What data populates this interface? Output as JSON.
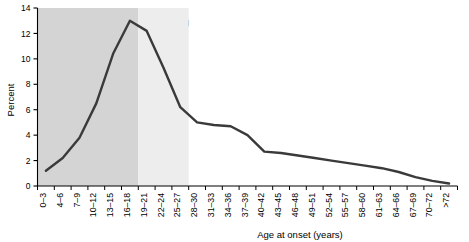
{
  "figure": {
    "background_color": "#ffffff",
    "line_color": "#3a3a3a",
    "axis_color": "#000000"
  },
  "annotations": {
    "child_band": {
      "label_line1": "Child",
      "label_line2": "onset",
      "fill_color": "#d4d4d4",
      "start_category": "0–3",
      "end_category": "16–18"
    },
    "young_adult_band": {
      "label_line1": "Young",
      "label_line2": "adult",
      "label_line3": "onset",
      "fill_color": "#ededed",
      "start_category": "19–21",
      "end_category": "25–27"
    }
  },
  "chart_data": {
    "type": "line",
    "title": "",
    "subtitle": "",
    "xlabel": "Age at onset (years)",
    "ylabel": "Percent",
    "ylim": [
      0,
      14
    ],
    "yticks": [
      0,
      2,
      4,
      6,
      8,
      10,
      12,
      14
    ],
    "ytick_labels": [
      "0",
      "2",
      "4",
      "6",
      "8",
      "10",
      "12",
      "14"
    ],
    "grid": false,
    "legend": null,
    "categories": [
      "0–3",
      "4–6",
      "7–9",
      "10–12",
      "13–15",
      "16–18",
      "19–21",
      "22–24",
      "25–27",
      "28–30",
      "31–33",
      "34–36",
      "37–39",
      "40–42",
      "43–45",
      "46–48",
      "49–51",
      "52–54",
      "55–57",
      "58–60",
      "61–63",
      "64–66",
      "67–69",
      "70–72",
      ">72"
    ],
    "values": [
      1.2,
      2.2,
      3.8,
      6.5,
      10.4,
      13.0,
      12.2,
      9.3,
      6.2,
      5.0,
      4.8,
      4.7,
      4.0,
      2.7,
      2.6,
      2.4,
      2.2,
      2.0,
      1.8,
      1.6,
      1.4,
      1.1,
      0.7,
      0.4,
      0.2
    ]
  }
}
